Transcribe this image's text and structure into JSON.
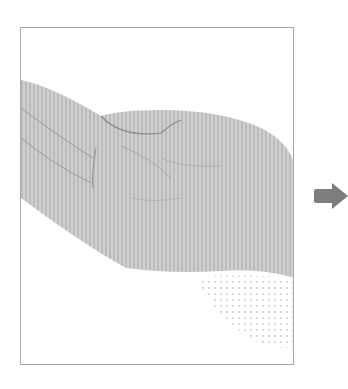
{
  "figure": {
    "frame_border_color": "#a8a8a8",
    "image_tone_color": "#b4b4b4",
    "crease_color": "#7a7a7a"
  },
  "arrow": {
    "icon": "right-arrow-icon",
    "color": "#7d7d7d"
  }
}
